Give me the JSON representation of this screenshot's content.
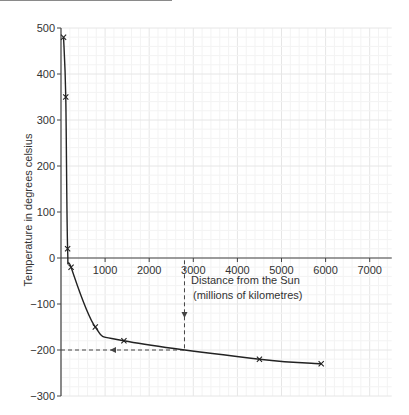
{
  "chart_data": {
    "type": "line",
    "title": "",
    "xlabel": "Distance from the Sun (millions of kilometres)",
    "xlabel_lines": [
      "Distance from the Sun",
      "(millions of kilometres)"
    ],
    "ylabel": "Temperature in degrees celsius",
    "xlim": [
      0,
      7500
    ],
    "ylim": [
      -300,
      500
    ],
    "x_ticks": [
      1000,
      2000,
      3000,
      4000,
      5000,
      6000,
      7000
    ],
    "y_ticks": [
      500,
      400,
      300,
      200,
      100,
      0,
      -100,
      -200,
      -300
    ],
    "y_tick_labels": [
      "500",
      "400",
      "300",
      "200",
      "100",
      "0",
      "−100",
      "−200",
      "−300"
    ],
    "grid": true,
    "marker": "x",
    "series": [
      {
        "name": "Planet temperature",
        "x": [
          58,
          108,
          150,
          228,
          778,
          1427,
          4500,
          5900
        ],
        "y": [
          480,
          350,
          20,
          -20,
          -150,
          -180,
          -220,
          -230
        ]
      }
    ],
    "annotations": [
      {
        "type": "dashed-arrow-down",
        "x": 2800,
        "from_y": -5,
        "to_y": -200
      },
      {
        "type": "dashed-arrow-left",
        "y": -200,
        "from_x": 2800,
        "to_x": 0
      }
    ]
  },
  "colors": {
    "line": "#222222",
    "axis": "#444444",
    "grid_major": "#e6e6e6",
    "grid_minor": "#f3f3f3",
    "dashed": "#444444"
  },
  "page": {
    "fragment_left_top": ""
  }
}
